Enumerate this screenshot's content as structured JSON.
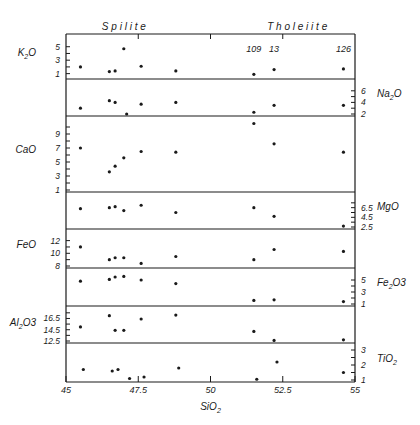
{
  "figure": {
    "group_labels": [
      {
        "text": "S p i l i t e",
        "x_center": 47.0
      },
      {
        "text": "T h o l e i i t e",
        "x_center": 53.0
      }
    ],
    "xlabel": "SiO",
    "xlabel_sub": "2",
    "colors": {
      "ink": "#1a1a1a",
      "background": "#ffffff"
    }
  },
  "chart_data": {
    "type": "scatter",
    "title": "",
    "xlabel": "SiO2",
    "xlim": [
      45,
      55
    ],
    "x_ticks": [
      45,
      47.5,
      50,
      52.5,
      55
    ],
    "x_tick_labels": [
      "45",
      "47.5",
      "50",
      "52.5",
      "55"
    ],
    "sample_labels": [
      {
        "text": "109",
        "x": 51.5
      },
      {
        "text": "13",
        "x": 52.2
      },
      {
        "text": "126",
        "x": 54.6
      }
    ],
    "panels": [
      {
        "name": "K2O",
        "label": "K",
        "label_sub": "2",
        "label_tail": "O",
        "axis_side": "left",
        "ylim": [
          0.5,
          6
        ],
        "ticks": [
          1,
          2,
          3,
          4,
          5
        ],
        "tick_labels": [
          "1",
          "3",
          "5"
        ],
        "tick_label_values": [
          1,
          3,
          5
        ],
        "points": [
          [
            45.5,
            2.0
          ],
          [
            46.5,
            1.3
          ],
          [
            46.7,
            1.4
          ],
          [
            47.0,
            4.7
          ],
          [
            47.6,
            2.1
          ],
          [
            48.8,
            1.4
          ],
          [
            51.5,
            0.9
          ],
          [
            52.2,
            1.6
          ],
          [
            54.6,
            1.7
          ]
        ]
      },
      {
        "name": "Na2O",
        "label": "Na",
        "label_sub": "2",
        "label_tail": "O",
        "axis_side": "right",
        "ylim": [
          2,
          7
        ],
        "ticks": [
          2,
          3,
          4,
          5,
          6
        ],
        "tick_labels": [
          "2",
          "4",
          "6"
        ],
        "tick_label_values": [
          2,
          4,
          6
        ],
        "points": [
          [
            45.5,
            3.0
          ],
          [
            46.5,
            4.3
          ],
          [
            46.7,
            4.0
          ],
          [
            47.1,
            2.0
          ],
          [
            47.6,
            3.7
          ],
          [
            48.8,
            4.0
          ],
          [
            51.5,
            2.3
          ],
          [
            52.2,
            3.5
          ],
          [
            54.6,
            3.5
          ]
        ]
      },
      {
        "name": "CaO",
        "label": "CaO",
        "label_sub": "",
        "label_tail": "",
        "axis_side": "left",
        "ylim": [
          1,
          11
        ],
        "ticks": [
          1,
          2,
          3,
          4,
          5,
          6,
          7,
          8,
          9,
          10
        ],
        "tick_labels": [
          "1",
          "3",
          "5",
          "7",
          "9"
        ],
        "tick_label_values": [
          1,
          3,
          5,
          7,
          9
        ],
        "points": [
          [
            45.5,
            7.0
          ],
          [
            46.5,
            3.6
          ],
          [
            46.7,
            4.4
          ],
          [
            47.0,
            5.6
          ],
          [
            47.6,
            6.5
          ],
          [
            48.8,
            6.4
          ],
          [
            51.5,
            10.5
          ],
          [
            52.2,
            7.6
          ],
          [
            54.6,
            6.4
          ]
        ]
      },
      {
        "name": "MgO",
        "label": "MgO",
        "label_sub": "",
        "label_tail": "",
        "axis_side": "right",
        "ylim": [
          2.5,
          8.5
        ],
        "ticks": [
          2.5,
          3.5,
          4.5,
          5.5,
          6.5,
          7.5
        ],
        "tick_labels": [
          "2.5",
          "4.5",
          "6.5"
        ],
        "tick_label_values": [
          2.5,
          4.5,
          6.5
        ],
        "points": [
          [
            45.5,
            6.3
          ],
          [
            46.5,
            6.5
          ],
          [
            46.7,
            6.7
          ],
          [
            47.0,
            5.9
          ],
          [
            47.6,
            7.0
          ],
          [
            48.8,
            5.5
          ],
          [
            51.5,
            6.5
          ],
          [
            52.2,
            4.7
          ],
          [
            54.6,
            2.7
          ]
        ]
      },
      {
        "name": "FeO",
        "label": "FeO",
        "label_sub": "",
        "label_tail": "",
        "axis_side": "left",
        "ylim": [
          8,
          13.2
        ],
        "ticks": [
          8,
          9,
          10,
          11,
          12
        ],
        "tick_labels": [
          "8",
          "10",
          "12"
        ],
        "tick_label_values": [
          8,
          10,
          12
        ],
        "points": [
          [
            45.5,
            11.0
          ],
          [
            46.5,
            9.0
          ],
          [
            46.7,
            9.3
          ],
          [
            47.0,
            9.3
          ],
          [
            47.6,
            8.4
          ],
          [
            48.8,
            9.5
          ],
          [
            51.5,
            9.0
          ],
          [
            52.2,
            10.6
          ],
          [
            54.6,
            10.3
          ]
        ]
      },
      {
        "name": "Fe2O3",
        "label": "Fe",
        "label_sub": "2",
        "label_tail": "O3",
        "axis_side": "right",
        "ylim": [
          1,
          6
        ],
        "ticks": [
          1,
          2,
          3,
          4,
          5
        ],
        "tick_labels": [
          "1",
          "3",
          "5"
        ],
        "tick_label_values": [
          1,
          3,
          5
        ],
        "points": [
          [
            45.5,
            4.8
          ],
          [
            46.5,
            5.1
          ],
          [
            46.7,
            5.5
          ],
          [
            47.0,
            5.6
          ],
          [
            47.6,
            5.0
          ],
          [
            48.8,
            4.4
          ],
          [
            51.5,
            1.6
          ],
          [
            52.2,
            1.7
          ],
          [
            54.6,
            1.4
          ]
        ]
      },
      {
        "name": "Al2O3",
        "label": "Al",
        "label_sub": "2",
        "label_tail": "O3",
        "axis_side": "left",
        "ylim": [
          12.5,
          18
        ],
        "ticks": [
          12.5,
          13.5,
          14.5,
          15.5,
          16.5,
          17.5
        ],
        "tick_labels": [
          "12.5",
          "14.5",
          "16.5"
        ],
        "tick_label_values": [
          12.5,
          14.5,
          16.5
        ],
        "points": [
          [
            45.5,
            15.0
          ],
          [
            46.5,
            17.0
          ],
          [
            46.7,
            14.4
          ],
          [
            47.0,
            14.4
          ],
          [
            47.6,
            16.4
          ],
          [
            48.8,
            17.1
          ],
          [
            51.5,
            14.2
          ],
          [
            52.2,
            12.6
          ],
          [
            54.6,
            12.7
          ]
        ]
      },
      {
        "name": "TiO2",
        "label": "TiO",
        "label_sub": "2",
        "label_tail": "",
        "axis_side": "right",
        "ylim": [
          1,
          3.2
        ],
        "ticks": [
          1,
          1.5,
          2,
          2.5,
          3
        ],
        "tick_labels": [
          "1",
          "2",
          "3"
        ],
        "tick_label_values": [
          1,
          2,
          3
        ],
        "points": [
          [
            45.6,
            1.7
          ],
          [
            46.6,
            1.6
          ],
          [
            46.8,
            1.7
          ],
          [
            47.2,
            1.1
          ],
          [
            47.7,
            1.2
          ],
          [
            48.9,
            1.8
          ],
          [
            51.6,
            1.05
          ],
          [
            52.3,
            2.2
          ],
          [
            54.6,
            1.5
          ]
        ]
      }
    ],
    "legend": null,
    "grid": false
  }
}
